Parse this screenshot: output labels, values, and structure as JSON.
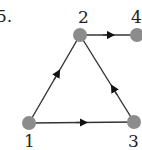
{
  "problem_number": "5.",
  "graph": {
    "directed": true,
    "nodes": [
      {
        "id": "1",
        "label": "1",
        "x": 29,
        "y": 123
      },
      {
        "id": "2",
        "label": "2",
        "x": 80,
        "y": 35
      },
      {
        "id": "3",
        "label": "3",
        "x": 134,
        "y": 122
      },
      {
        "id": "4",
        "label": "4",
        "x": 137,
        "y": 35
      }
    ],
    "edges": [
      {
        "from": "1",
        "to": "2"
      },
      {
        "from": "1",
        "to": "3"
      },
      {
        "from": "3",
        "to": "2"
      },
      {
        "from": "2",
        "to": "4"
      }
    ]
  },
  "colors": {
    "node_fill": "#8c8c8c",
    "edge": "#333333",
    "arrow": "#111111",
    "label": "#222222"
  }
}
